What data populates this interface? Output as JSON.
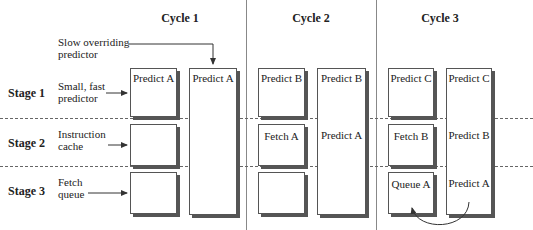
{
  "cycles": [
    {
      "label": "Cycle 1"
    },
    {
      "label": "Cycle 2"
    },
    {
      "label": "Cycle 3"
    }
  ],
  "stages": [
    {
      "label": "Stage 1",
      "component": [
        "Small, fast",
        "predictor"
      ]
    },
    {
      "label": "Stage 2",
      "component": [
        "Instruction",
        "cache"
      ]
    },
    {
      "label": "Stage 3",
      "component": [
        "Fetch",
        "queue"
      ]
    }
  ],
  "slow_predictor_label": [
    "Slow overriding",
    "predictor"
  ],
  "pipeline": {
    "cycle1": {
      "fast": [
        "Predict A",
        "",
        ""
      ],
      "slow": [
        "Predict A",
        "",
        ""
      ]
    },
    "cycle2": {
      "fast": [
        "Predict B",
        "Fetch A",
        ""
      ],
      "slow": [
        "Predict B",
        "Predict A",
        ""
      ]
    },
    "cycle3": {
      "fast": [
        "Predict C",
        "Fetch B",
        "Queue A"
      ],
      "slow": [
        "Predict C",
        "Predict B",
        "Predict A"
      ]
    }
  },
  "colors": {
    "line": "#555555",
    "shadow": "#555555",
    "separator": "#888888"
  }
}
